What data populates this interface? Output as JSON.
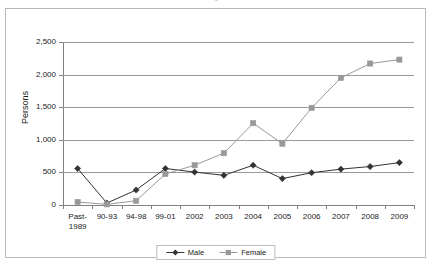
{
  "title_fragment": "▪",
  "chart_data": {
    "type": "line",
    "title": "",
    "xlabel": "",
    "ylabel": "Persons",
    "ylim": [
      0,
      2500
    ],
    "ytick_step": 500,
    "ytick_labels": [
      "0",
      "500",
      "1,000",
      "1,500",
      "2,000",
      "2,500"
    ],
    "ytick_values": [
      0,
      500,
      1000,
      1500,
      2000,
      2500
    ],
    "grid": true,
    "grid_axis": "y",
    "legend_position": "bottom-center",
    "categories": [
      "Past-\n1989",
      "90-93",
      "94-98",
      "99-01",
      "2002",
      "2003",
      "2004",
      "2005",
      "2006",
      "2007",
      "2008",
      "2009"
    ],
    "series": [
      {
        "name": "Male",
        "color": "#333333",
        "marker": "diamond",
        "values": [
          560,
          30,
          230,
          560,
          505,
          455,
          610,
          405,
          495,
          550,
          590,
          650
        ]
      },
      {
        "name": "Female",
        "color": "#999999",
        "marker": "square",
        "values": [
          45,
          10,
          65,
          475,
          610,
          795,
          1255,
          940,
          1490,
          1950,
          2170,
          2230
        ]
      }
    ]
  },
  "colors": {
    "male": "#333333",
    "female": "#999999",
    "gridline": "#9a9a9a",
    "axis": "#808080",
    "frame": "#b9b9b9",
    "background": "#ffffff",
    "text": "#1a1a1a"
  }
}
